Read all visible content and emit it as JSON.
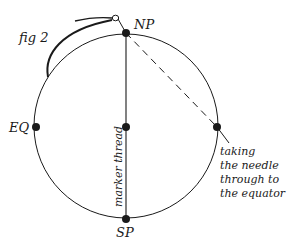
{
  "figure": {
    "label": "fig 2",
    "colors": {
      "ink": "#1a1a1a",
      "background": "#ffffff"
    }
  },
  "points": {
    "north_pole": "NP",
    "south_pole": "SP",
    "equator": "EQ"
  },
  "annotations": {
    "marker_thread": "marker thread",
    "needle_caption": [
      "taking",
      "the needle",
      "through to",
      "the equator"
    ]
  },
  "icons": {
    "needle": "needle-icon",
    "dot": "point-marker"
  }
}
